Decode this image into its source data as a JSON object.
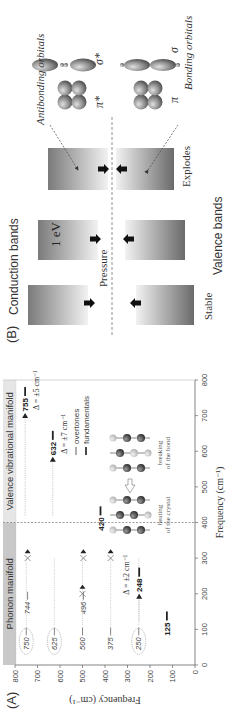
{
  "figure": {
    "panel_a_label": "(A)",
    "panel_b_label": "(B)"
  },
  "chart_data": {
    "type": "scatter",
    "title": "",
    "xlabel": "Frequency (cm⁻¹)",
    "ylabel": "Frequency (cm⁻¹)",
    "xlim": [
      0,
      800
    ],
    "ylim": [
      0,
      800
    ],
    "xticks": [
      0,
      100,
      200,
      300,
      400,
      500,
      600,
      700,
      800
    ],
    "yticks": [
      0,
      100,
      200,
      300,
      400,
      500,
      600,
      700,
      800
    ],
    "grid": false,
    "regions": [
      {
        "name": "Phonon manifold",
        "x_range": [
          0,
          400
        ],
        "color": "#c8c8c8"
      },
      {
        "name": "Valence vibrational manifold",
        "x_range": [
          400,
          800
        ],
        "color": "#e6e6e6"
      }
    ],
    "divider_x": 400,
    "overtones": [
      {
        "x": 100,
        "y": 750,
        "label": "750",
        "circled": true
      },
      {
        "x": 100,
        "y": 625,
        "label": "625",
        "circled": true
      },
      {
        "x": 100,
        "y": 500,
        "label": "500",
        "circled": false
      },
      {
        "x": 100,
        "y": 375,
        "label": "375",
        "circled": false
      },
      {
        "x": 100,
        "y": 250,
        "label": "250",
        "circled": true
      },
      {
        "x": 200,
        "y": 744,
        "label": "744",
        "circled": false
      },
      {
        "x": 200,
        "y": 496,
        "label": "496",
        "circled": false
      }
    ],
    "fundamentals": [
      {
        "x": 125,
        "y": 125,
        "label": "125"
      },
      {
        "x": 248,
        "y": 248,
        "label": "248"
      },
      {
        "x": 420,
        "y": 420,
        "label": "420"
      },
      {
        "x": 632,
        "y": 632,
        "label": "632"
      },
      {
        "x": 755,
        "y": 755,
        "label": "755"
      }
    ],
    "crossed_markers": [
      {
        "x": 200,
        "y": 500
      },
      {
        "x": 300,
        "y": 375
      },
      {
        "x": 300,
        "y": 744
      },
      {
        "x": 300,
        "y": 496
      }
    ],
    "annotations": [
      {
        "text": "Δ = ±2 cm⁻¹",
        "near": 248
      },
      {
        "text": "Δ = ±7 cm⁻¹",
        "near": 632
      },
      {
        "text": "Δ = ±5 cm⁻¹",
        "near": 755
      }
    ],
    "legend": {
      "placement": "center-right",
      "entries": [
        {
          "label": "overtones",
          "style": "thin"
        },
        {
          "label": "fundamentals",
          "style": "thick"
        }
      ]
    },
    "inset_labels": {
      "left": [
        "heating",
        "of the crystal"
      ],
      "right": [
        "breaking",
        "of the bond"
      ]
    }
  },
  "panel_b": {
    "conduction_label": "Conduction bands",
    "valence_label": "Valence bands",
    "pressure_label": "Pressure",
    "gap_label": "1 eV",
    "states": [
      "Stable",
      "",
      "Explodes"
    ],
    "orbitals": {
      "antibonding_label": "Antibonding orbitals",
      "bonding_label": "Bonding orbitals",
      "pi_star": "π*",
      "sigma_star": "σ*",
      "pi": "π",
      "sigma": "σ"
    }
  }
}
